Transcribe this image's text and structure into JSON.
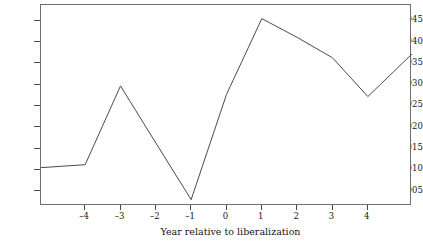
{
  "chart_data": {
    "type": "line",
    "title": "",
    "subtitle": "",
    "xlabel": "Year relative to liberalization",
    "ylabel": "",
    "xlim": [
      -5.25,
      5.25
    ],
    "ylim": [
      0.0015,
      0.0487
    ],
    "xticks": [
      -4,
      -3,
      -2,
      -1,
      0,
      1,
      2,
      3,
      4
    ],
    "xtick_labels": [
      "–4",
      "–3",
      "–2",
      "–1",
      "0",
      "1",
      "2",
      "3",
      "4"
    ],
    "yticks": [
      0.005,
      0.01,
      0.015,
      0.02,
      0.025,
      0.03,
      0.035,
      0.04,
      0.045
    ],
    "ytick_labels": [
      "0.005",
      "0.010",
      "0.015",
      "0.020",
      "0.025",
      "0.030",
      "0.035",
      "0.040",
      "0.045"
    ],
    "grid": false,
    "legend": null,
    "legend_position": "none",
    "line_color": "#4a4a4a",
    "line_width": 1,
    "frame_color": "#6e6e6e",
    "background": "#ffffff",
    "series": [
      {
        "name": "series-1",
        "x": [
          -5.25,
          -4,
          -3,
          -2,
          -1,
          0,
          1,
          2,
          3,
          4,
          5.25
        ],
        "values": [
          0.0105,
          0.0112,
          0.0297,
          0.0163,
          0.003,
          0.0277,
          0.0455,
          0.0411,
          0.0363,
          0.0272,
          0.0372
        ]
      }
    ]
  },
  "axis": {
    "x_title": "Year relative to liberalization"
  }
}
